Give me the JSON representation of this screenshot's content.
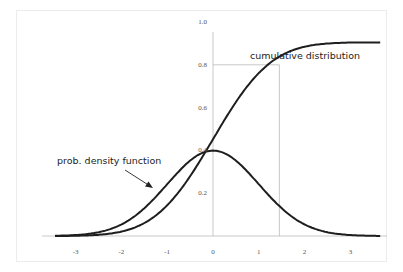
{
  "chart_data": {
    "type": "line",
    "title": "",
    "xlabel": "",
    "ylabel": "",
    "xlim": [
      -3.5,
      3.7
    ],
    "ylim": [
      0,
      1.05
    ],
    "grid": false,
    "legend": "none (inline annotations)",
    "x_ticks": [
      "-3",
      "-2",
      "-1",
      "0",
      "1",
      "2",
      "3"
    ],
    "y_ticks": [
      "0.2",
      "0.4",
      "0.6",
      "0.8",
      "1.0"
    ],
    "series": [
      {
        "name": "prob. density function",
        "x": [
          -3.5,
          -3,
          -2.5,
          -2,
          -1.5,
          -1,
          -0.5,
          0,
          0.5,
          1,
          1.5,
          2,
          2.5,
          3,
          3.5
        ],
        "values": [
          0.001,
          0.004,
          0.018,
          0.054,
          0.13,
          0.242,
          0.352,
          0.399,
          0.352,
          0.242,
          0.13,
          0.054,
          0.018,
          0.004,
          0.001
        ]
      },
      {
        "name": "cumulative distribution",
        "x": [
          -3.5,
          -3,
          -2.5,
          -2,
          -1.5,
          -1,
          -0.5,
          0,
          0.5,
          1,
          1.5,
          2,
          2.5,
          3,
          3.5
        ],
        "values": [
          0.0002,
          0.001,
          0.006,
          0.023,
          0.067,
          0.159,
          0.309,
          0.5,
          0.691,
          0.841,
          0.933,
          0.977,
          0.994,
          0.999,
          1.0
        ]
      }
    ],
    "annotations": [
      {
        "text": "cumulative distribution",
        "target": "cumulative distribution curve"
      },
      {
        "text": "prob. density function",
        "arrow": true,
        "target": "density curve near x=-1"
      },
      {
        "type": "guide-lines",
        "x": 1.45,
        "y": 0.8,
        "description": "vertical line at x≈1.45 and horizontal line at y=0.8 to the y-axis"
      }
    ]
  },
  "labels": {
    "cdf": "cumulative distribution",
    "pdf": "prob. density function"
  }
}
